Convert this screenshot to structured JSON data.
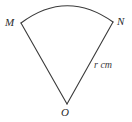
{
  "figure": {
    "kind": "circular-sector-diagram",
    "background_color": "#ffffff",
    "stroke_color": "#3a3a3a",
    "stroke_width": 1.1,
    "width": 132,
    "height": 122
  },
  "labels": {
    "center_vertex": "O",
    "arc_start_vertex": "M",
    "arc_end_vertex": "N",
    "radius_measure": "r cm"
  },
  "geometry": {
    "center": {
      "x": 67,
      "y": 104
    },
    "arc_start": {
      "x": 21,
      "y": 23
    },
    "arc_end": {
      "x": 113,
      "y": 22
    },
    "arc_apex": {
      "x": 66,
      "y": 5
    },
    "radius_px": 94,
    "sector_angle_deg": 58
  }
}
